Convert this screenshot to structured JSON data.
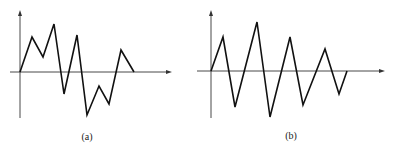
{
  "panels": [
    {
      "label": "(a)",
      "label_pos": [
        87,
        131
      ],
      "y_axis": {
        "x": 20,
        "y_top": 10,
        "y_bottom": 118
      },
      "x_axis": {
        "y": 72,
        "x_left": 10,
        "x_right": 172
      },
      "points": [
        [
          20,
          72
        ],
        [
          32,
          37
        ],
        [
          43,
          57
        ],
        [
          54,
          24
        ],
        [
          64,
          94
        ],
        [
          77,
          35
        ],
        [
          87,
          115
        ],
        [
          99,
          86
        ],
        [
          109,
          104
        ],
        [
          121,
          50
        ],
        [
          134,
          72
        ]
      ]
    },
    {
      "label": "(b)",
      "label_pos": [
        291,
        130
      ],
      "y_axis": {
        "x": 211,
        "y_top": 10,
        "y_bottom": 118
      },
      "x_axis": {
        "y": 71,
        "x_left": 197,
        "x_right": 385
      },
      "points": [
        [
          211,
          71
        ],
        [
          223,
          37
        ],
        [
          235,
          107
        ],
        [
          257,
          22
        ],
        [
          270,
          117
        ],
        [
          290,
          37
        ],
        [
          303,
          105
        ],
        [
          325,
          49
        ],
        [
          339,
          94
        ],
        [
          347,
          71
        ]
      ]
    }
  ]
}
